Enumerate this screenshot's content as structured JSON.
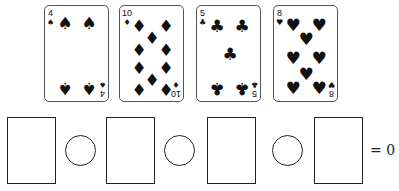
{
  "cards": [
    {
      "rank": "4",
      "suit": "spades",
      "symbol": "♠"
    },
    {
      "rank": "10",
      "suit": "diamonds",
      "symbol": "♦"
    },
    {
      "rank": "5",
      "suit": "clubs",
      "symbol": "♣"
    },
    {
      "rank": "8",
      "suit": "hearts",
      "symbol": "♥"
    }
  ],
  "equation": {
    "boxes": 4,
    "operator_circles": 3,
    "equals": "=",
    "result": "0"
  }
}
